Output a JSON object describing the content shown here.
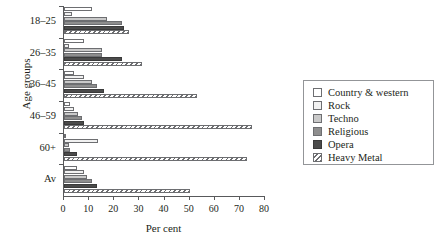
{
  "chart_data": {
    "type": "bar",
    "orientation": "horizontal",
    "title": "",
    "xlabel": "Per cent",
    "ylabel": "Age groups",
    "categories": [
      "18–25",
      "26–35",
      "36–45",
      "46–59",
      "60+",
      "Av"
    ],
    "xlim": [
      0,
      80
    ],
    "xticks": [
      0,
      10,
      20,
      30,
      40,
      50,
      60,
      70,
      80
    ],
    "xticklabels": [
      "0",
      "10",
      "20",
      "30",
      "40",
      "50",
      "60",
      "70",
      "80"
    ],
    "grid": false,
    "legend_position": "right",
    "series": [
      {
        "name": "Country & western",
        "fill": "white",
        "values": [
          11,
          8,
          4,
          2.5,
          0.5,
          5
        ]
      },
      {
        "name": "Rock",
        "fill": "very-light",
        "values": [
          3,
          2,
          8,
          4,
          13.5,
          8
        ]
      },
      {
        "name": "Techno",
        "fill": "light-gray",
        "values": [
          17,
          15,
          11,
          5.5,
          2,
          9
        ]
      },
      {
        "name": "Religious",
        "fill": "medium-gray",
        "values": [
          23,
          15,
          13,
          7,
          2.5,
          11
        ]
      },
      {
        "name": "Opera",
        "fill": "dark-gray",
        "values": [
          24,
          23,
          16,
          8,
          5,
          13
        ]
      },
      {
        "name": "Heavy Metal",
        "fill": "hatched",
        "values": [
          26,
          31,
          53,
          75,
          73,
          50
        ]
      }
    ]
  },
  "legend": {
    "items": [
      {
        "label": "Country & western"
      },
      {
        "label": "Rock"
      },
      {
        "label": "Techno"
      },
      {
        "label": "Religious"
      },
      {
        "label": "Opera"
      },
      {
        "label": "Heavy Metal"
      }
    ]
  }
}
